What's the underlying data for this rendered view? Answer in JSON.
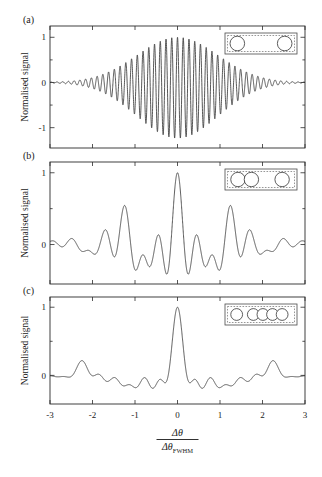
{
  "figure": {
    "ylabel": "Normalised signal",
    "xlabel_numerator": "Δθ",
    "xlabel_denominator_base": "Δθ",
    "xlabel_denominator_sub": "FWHM",
    "xticks": [
      "-3",
      "-2",
      "-1",
      "0",
      "1",
      "2",
      "3"
    ],
    "xtick_values": [
      -3,
      -2,
      -1,
      0,
      1,
      2,
      3
    ],
    "xlim": [
      -3,
      3
    ],
    "curve_color": "#3a3a3a",
    "axis_color": "#2b2b2b",
    "background": "#ffffff"
  },
  "panels": [
    {
      "label": "(a)",
      "yticks": [
        "-1",
        "0",
        "1"
      ],
      "ytick_values": [
        -1,
        0,
        1
      ],
      "ylim": [
        -1.45,
        1.25
      ],
      "ylabel": "Normalised signal",
      "inset": {
        "name": "two-aperture-array",
        "apertures": 4,
        "positions": [
          0.13,
          0.87
        ],
        "radius": 0.105
      }
    },
    {
      "label": "(b)",
      "yticks": [
        "0",
        "1"
      ],
      "ytick_values": [
        0,
        1
      ],
      "ylim": [
        -0.55,
        1.15
      ],
      "ylabel": "Normalised signal",
      "inset": {
        "name": "three-aperture-array",
        "apertures": 3,
        "positions": [
          0.14,
          0.35,
          0.83
        ],
        "radius": 0.1
      }
    },
    {
      "label": "(c)",
      "yticks": [
        "0",
        "1"
      ],
      "ytick_values": [
        0,
        1
      ],
      "ylim": [
        -0.42,
        1.15
      ],
      "ylabel": "Normalised signal",
      "inset": {
        "name": "five-aperture-array",
        "apertures": 5,
        "positions": [
          0.12,
          0.38,
          0.53,
          0.68,
          0.83
        ],
        "radius": 0.082
      }
    }
  ],
  "chart_data": {
    "type": "line",
    "title": "",
    "xlabel": "Δθ / Δθ_FWHM",
    "ylabel": "Normalised signal",
    "xlim": [
      -3,
      3
    ],
    "grid": false,
    "legend": "none",
    "panels": [
      {
        "name": "(a)",
        "description": "Two-aperture interference: high-frequency sinusoidal fringes under a Gaussian envelope",
        "ylim": [
          -1.45,
          1.25
        ],
        "yticks": [
          -1,
          0,
          1
        ],
        "model": {
          "kind": "gaussian-modulated-cosine",
          "envelope_sigma": 0.95,
          "fringe_frequency": 7.4,
          "amplitude": 1.15,
          "baseline_offset": -0.12
        },
        "annotations": [
          "central fringe peak = 1 at x = 0"
        ]
      },
      {
        "name": "(b)",
        "description": "Three-aperture non-redundant array: central peak with two strong side peaks",
        "ylim": [
          -0.55,
          1.15
        ],
        "yticks": [
          0,
          1
        ],
        "model": {
          "kind": "multi-baseline-interference",
          "aperture_positions": [
            0.0,
            0.72,
            2.38
          ],
          "envelope_sigma": 1.25,
          "peak_positions": [
            -0.72,
            0.0,
            0.72
          ],
          "peak_values": [
            0.71,
            1.0,
            0.71
          ],
          "secondary_peaks": [
            -1.66,
            1.66
          ],
          "secondary_values": [
            0.26,
            0.26
          ],
          "minimum_level": -0.4
        }
      },
      {
        "name": "(c)",
        "description": "Five-aperture array: single sharp central peak, low side lobes",
        "ylim": [
          -0.42,
          1.15
        ],
        "yticks": [
          0,
          1
        ],
        "model": {
          "kind": "multi-baseline-interference",
          "aperture_positions": [
            0.0,
            1.3,
            1.75,
            2.2,
            2.65
          ],
          "envelope_sigma": 1.3,
          "peak_positions": [
            0.0
          ],
          "peak_values": [
            1.0
          ],
          "secondary_peaks": [
            -1.18,
            1.18
          ],
          "secondary_values": [
            0.24,
            0.24
          ],
          "minimum_level": -0.26
        }
      }
    ]
  }
}
